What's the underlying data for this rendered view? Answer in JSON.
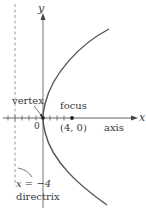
{
  "diagram": {
    "type": "parabola",
    "equation_implied": "y^2 = 16x",
    "colors": {
      "curve": "#555555",
      "axis": "#666666",
      "directrix": "#999999",
      "text": "#3a3a3a",
      "background": "#ffffff"
    },
    "axes": {
      "x_label": "x",
      "y_label": "y",
      "origin_label": "0",
      "tick_spacing_units": 1
    },
    "labels": {
      "vertex": "vertex",
      "focus": "focus",
      "focus_coords": "(4, 0)",
      "axis": "axis",
      "directrix_eq": "x = −4",
      "directrix": "directrix"
    },
    "points": {
      "vertex": [
        0,
        0
      ],
      "focus": [
        4,
        0
      ]
    },
    "directrix_x": -4
  }
}
